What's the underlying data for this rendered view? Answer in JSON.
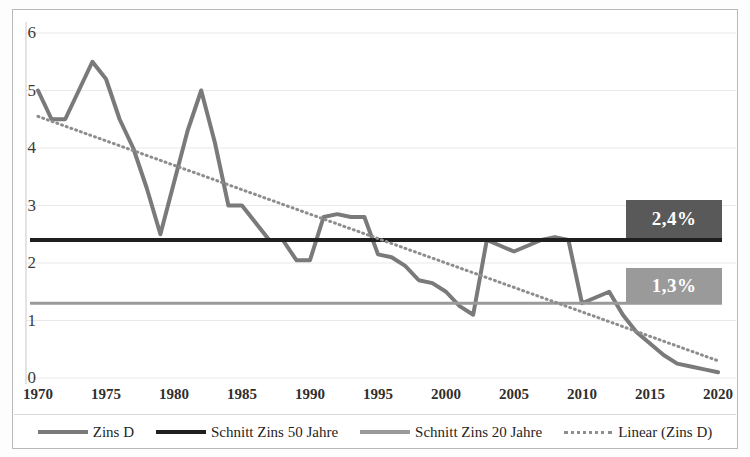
{
  "chart_data": {
    "type": "line",
    "title": "",
    "xlabel": "",
    "ylabel": "",
    "xlim": [
      1970,
      2020
    ],
    "ylim": [
      0,
      6
    ],
    "grid": true,
    "legend_position": "bottom",
    "y_ticks": [
      "6",
      "5",
      "4",
      "3",
      "2",
      "1",
      "0"
    ],
    "x_ticks": [
      "1970",
      "1975",
      "1980",
      "1985",
      "1990",
      "1995",
      "2000",
      "2005",
      "2010",
      "2015",
      "2020"
    ],
    "annotations": [
      {
        "name": "schnitt-50-label",
        "text": "2,4%",
        "value": 2.4,
        "color": "#595959"
      },
      {
        "name": "schnitt-20-label",
        "text": "1,3%",
        "value": 1.3,
        "color": "#9a9a9a"
      }
    ],
    "series": [
      {
        "name": "Zins D",
        "type": "line",
        "color": "#7a7a7a",
        "style": "solid",
        "width": 4,
        "x": [
          1970,
          1971,
          1972,
          1973,
          1974,
          1975,
          1976,
          1977,
          1978,
          1979,
          1980,
          1981,
          1982,
          1983,
          1984,
          1985,
          1986,
          1987,
          1988,
          1989,
          1990,
          1991,
          1992,
          1993,
          1994,
          1995,
          1996,
          1997,
          1998,
          1999,
          2000,
          2001,
          2002,
          2003,
          2004,
          2005,
          2006,
          2007,
          2008,
          2009,
          2010,
          2011,
          2012,
          2013,
          2014,
          2015,
          2016,
          2017,
          2018,
          2019,
          2020
        ],
        "values": [
          5.0,
          4.5,
          4.5,
          5.0,
          5.5,
          5.2,
          4.5,
          4.0,
          3.3,
          2.5,
          3.4,
          4.3,
          5.0,
          4.1,
          3.0,
          3.0,
          2.7,
          2.4,
          2.4,
          2.05,
          2.05,
          2.8,
          2.85,
          2.8,
          2.8,
          2.15,
          2.1,
          1.95,
          1.7,
          1.65,
          1.5,
          1.25,
          1.1,
          2.4,
          2.3,
          2.2,
          2.3,
          2.4,
          2.45,
          2.4,
          1.3,
          1.4,
          1.5,
          1.1,
          0.8,
          0.6,
          0.4,
          0.25,
          0.2,
          0.15,
          0.1
        ]
      },
      {
        "name": "Schnitt Zins 50 Jahre",
        "type": "hline",
        "color": "#1f1f1f",
        "style": "solid",
        "width": 4,
        "value": 2.4
      },
      {
        "name": "Schnitt Zins 20 Jahre",
        "type": "hline",
        "color": "#9a9a9a",
        "style": "solid",
        "width": 3,
        "value": 1.3
      },
      {
        "name": "Linear (Zins D)",
        "type": "trendline",
        "color": "#8d8d8d",
        "style": "dotted",
        "width": 3,
        "x": [
          1970,
          2020
        ],
        "values": [
          4.55,
          0.3
        ]
      }
    ]
  },
  "legend": {
    "items": [
      {
        "label": "Zins D",
        "color": "#7a7a7a",
        "style": "solid"
      },
      {
        "label": "Schnitt Zins 50 Jahre",
        "color": "#1f1f1f",
        "style": "solid"
      },
      {
        "label": "Schnitt Zins 20 Jahre",
        "color": "#9a9a9a",
        "style": "solid"
      },
      {
        "label": "Linear (Zins D)",
        "color": "#8d8d8d",
        "style": "dotted"
      }
    ]
  }
}
